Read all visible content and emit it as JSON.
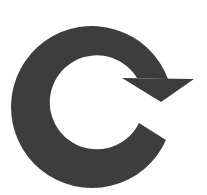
{
  "icon": {
    "name": "refresh-icon",
    "color": "#3d3d3d",
    "background": "#ffffff"
  }
}
